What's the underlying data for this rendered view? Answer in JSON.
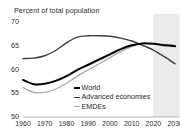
{
  "chart_data": {
    "type": "line",
    "title": "Percent of total population",
    "xlabel": "",
    "ylabel": "",
    "ylim": [
      50,
      70
    ],
    "xlim": [
      1960,
      2032
    ],
    "grid": false,
    "legend_position": "center",
    "yticks": [
      "70",
      "65",
      "60",
      "55",
      "50"
    ],
    "xticks": [
      "1960",
      "1970",
      "1980",
      "1990",
      "2000",
      "2010",
      "2020",
      "2030"
    ],
    "shaded_projection": {
      "label": "",
      "start": 2020,
      "end": 2032,
      "color": "#eceaea"
    },
    "x": [
      1960,
      1965,
      1970,
      1975,
      1980,
      1985,
      1990,
      1995,
      2000,
      2005,
      2010,
      2015,
      2020,
      2025,
      2030
    ],
    "series": [
      {
        "name": "World",
        "color": "#000000",
        "width": 2.0,
        "values": [
          57.8,
          56.9,
          57.0,
          57.6,
          58.6,
          59.9,
          61.0,
          62.1,
          63.2,
          64.3,
          65.1,
          65.5,
          65.4,
          65.1,
          64.9
        ]
      },
      {
        "name": "Advanced economies",
        "color": "#3d3d3d",
        "width": 1.4,
        "values": [
          62.3,
          62.4,
          62.9,
          64.0,
          65.6,
          66.8,
          67.1,
          67.1,
          67.0,
          66.6,
          66.0,
          65.1,
          64.1,
          62.7,
          61.2
        ]
      },
      {
        "name": "EMDEs",
        "color": "#a8a8a8",
        "width": 1.3,
        "values": [
          56.2,
          55.2,
          55.2,
          55.9,
          57.1,
          58.6,
          59.9,
          61.2,
          62.5,
          63.8,
          64.8,
          65.4,
          65.5,
          65.3,
          65.1
        ]
      }
    ]
  }
}
